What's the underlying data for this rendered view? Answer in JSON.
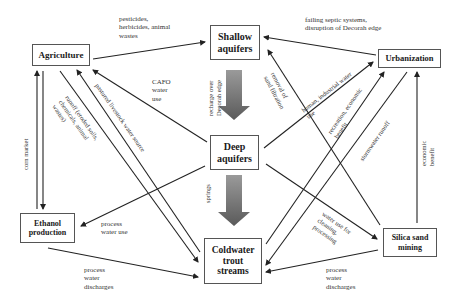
{
  "nodes": {
    "agriculture": "Agriculture",
    "shallow_aquifers": "Shallow aquifers",
    "urbanization": "Urbanization",
    "deep_aquifers": "Deep aquifers",
    "ethanol_production": "Ethanol production",
    "coldwater_trout_streams": "Coldwater trout streams",
    "silica_sand_mining": "Silica sand mining"
  },
  "edges": {
    "ag_to_shallow": "pesticides, herbicides, animal wastes",
    "urban_to_shallow": "failing septic systems, disruption of Decorah edge",
    "shallow_to_deep": "recharge over Decorah edge",
    "deep_to_ag": "CAFO water use",
    "streams_to_ag": "pastured livestock water source",
    "ag_to_streams": "runoff (eroded soils, chemicals, animal wastes)",
    "ag_ethanol": "corn market",
    "mining_to_shallow": "removal of sand filtration",
    "deep_to_urban": "human, industrial water use",
    "streams_to_urban": "recreation, economic benefit",
    "urban_to_streams": "stormwater runoff",
    "mining_to_urban": "economic benefit",
    "deep_to_streams": "springs",
    "deep_to_ethanol": "process water use",
    "ethanol_to_streams": "process water discharges",
    "deep_to_mining": "water use for cleaning, processing",
    "mining_to_streams": "process water discharges"
  }
}
